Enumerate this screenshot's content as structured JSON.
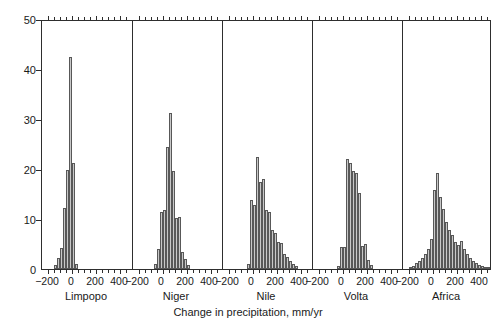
{
  "chart_data": {
    "type": "bar",
    "subtype": "histogram",
    "title": "",
    "xlabel": "Change in precipitation, mm/yr",
    "ylabel": "Percent of observations",
    "ylim": [
      0,
      50
    ],
    "yticks": [
      0,
      10,
      20,
      30,
      40,
      50
    ],
    "xlim": [
      -250,
      500
    ],
    "xticks": [
      -200,
      0,
      200,
      400
    ],
    "xtick_labels": [
      "−200",
      "0",
      "200",
      "400"
    ],
    "grid": false,
    "legend": null,
    "bin_width": 25,
    "panels": [
      {
        "name": "Limpopo",
        "bins": [
          -150,
          -125,
          -100,
          -75,
          -50,
          -25,
          0,
          25
        ],
        "values": [
          0.8,
          2.2,
          4.3,
          12.2,
          19.8,
          42.5,
          21.2,
          1.0
        ]
      },
      {
        "name": "Niger",
        "bins": [
          -75,
          -50,
          -25,
          0,
          25,
          50,
          75,
          100,
          125,
          150,
          175,
          200
        ],
        "values": [
          1.0,
          4.0,
          11.5,
          11.8,
          24.4,
          31.2,
          19.6,
          10.3,
          10.4,
          3.5,
          2.0,
          0.8
        ]
      },
      {
        "name": "Nile",
        "bins": [
          -50,
          -25,
          0,
          25,
          50,
          75,
          100,
          125,
          150,
          175,
          200,
          225,
          250,
          275,
          300,
          325,
          350
        ],
        "values": [
          1.0,
          13.8,
          12.9,
          22.5,
          17.5,
          18.0,
          11.8,
          11.5,
          7.8,
          7.2,
          5.5,
          5.3,
          3.0,
          2.5,
          1.6,
          1.0,
          0.6
        ]
      },
      {
        "name": "Volta",
        "bins": [
          -50,
          -25,
          0,
          25,
          50,
          75,
          100,
          125,
          150,
          175,
          200,
          225
        ],
        "values": [
          0.7,
          4.5,
          4.4,
          22.0,
          21.2,
          19.6,
          19.2,
          15.3,
          4.6,
          5.0,
          1.8,
          0.8
        ]
      },
      {
        "name": "Africa",
        "bins": [
          -200,
          -175,
          -150,
          -125,
          -100,
          -75,
          -50,
          -25,
          0,
          25,
          50,
          75,
          100,
          125,
          150,
          175,
          200,
          225,
          250,
          275,
          300,
          325,
          350,
          375,
          400,
          425,
          450
        ],
        "values": [
          0.4,
          0.7,
          1.2,
          1.6,
          2.2,
          3.0,
          4.0,
          6.0,
          15.8,
          19.2,
          14.4,
          12.0,
          9.5,
          7.8,
          6.8,
          5.5,
          4.8,
          5.6,
          4.0,
          3.0,
          2.2,
          1.6,
          1.2,
          0.9,
          0.6,
          0.4,
          0.3
        ]
      }
    ]
  },
  "colors": {
    "bar_fill": "#c8c8c8",
    "bar_edge": "#585858",
    "axis": "#2e2e2e",
    "text": "#1a1a1a",
    "background": "#ffffff"
  }
}
